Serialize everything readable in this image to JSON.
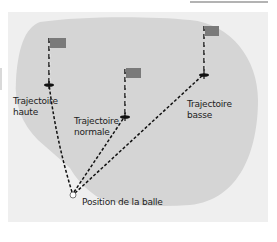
{
  "diagram": {
    "type": "golf-green-trajectories",
    "colors": {
      "page_background": "#ffffff",
      "panel_background": "#efefef",
      "green_area": "#d5d5d5",
      "flag": "#7a7a7a",
      "lines": "#111111",
      "top_rule": "#9a9a9a"
    },
    "flags": [
      {
        "id": "haute",
        "flag_x": 50,
        "flag_y": 38,
        "pin_x": 49,
        "pin_y": 84
      },
      {
        "id": "normale",
        "flag_x": 125,
        "flag_y": 69,
        "pin_x": 125,
        "pin_y": 116
      },
      {
        "id": "basse",
        "flag_x": 204,
        "flag_y": 26,
        "pin_x": 204,
        "pin_y": 74
      }
    ],
    "ball": {
      "x": 73,
      "y": 194
    },
    "labels": {
      "trajectoire_haute_1": "Trajectoire",
      "trajectoire_haute_2": "haute",
      "trajectoire_normale_1": "Trajectoire",
      "trajectoire_normale_2": "normale",
      "trajectoire_basse_1": "Trajectoire",
      "trajectoire_basse_2": "basse",
      "position_balle": "Position de la balle"
    }
  }
}
